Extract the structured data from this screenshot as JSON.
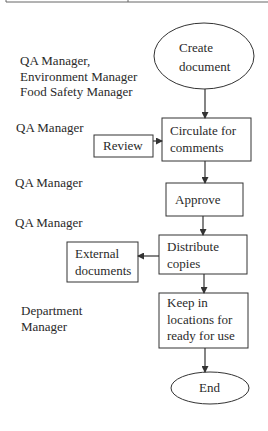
{
  "diagram": {
    "type": "flowchart",
    "roles": [
      {
        "id": "role-create",
        "lines": [
          "QA Manager,",
          "Environment Manager",
          "Food Safety Manager"
        ]
      },
      {
        "id": "role-circulate",
        "lines": [
          "QA Manager"
        ]
      },
      {
        "id": "role-approve",
        "lines": [
          "QA Manager"
        ]
      },
      {
        "id": "role-distribute",
        "lines": [
          "QA Manager"
        ]
      },
      {
        "id": "role-keep",
        "lines": [
          "Department",
          "Manager"
        ]
      }
    ],
    "nodes": [
      {
        "id": "create",
        "shape": "ellipse",
        "lines": [
          "Create",
          "document"
        ]
      },
      {
        "id": "circulate",
        "shape": "rect",
        "lines": [
          "Circulate for",
          "comments"
        ]
      },
      {
        "id": "review",
        "shape": "rect",
        "lines": [
          "Review"
        ]
      },
      {
        "id": "approve",
        "shape": "rect",
        "lines": [
          "Approve"
        ]
      },
      {
        "id": "distribute",
        "shape": "rect",
        "lines": [
          "Distribute",
          "copies"
        ]
      },
      {
        "id": "external",
        "shape": "rect",
        "lines": [
          "External",
          "documents"
        ]
      },
      {
        "id": "keep",
        "shape": "rect",
        "lines": [
          "Keep in",
          "locations for",
          "ready for use"
        ]
      },
      {
        "id": "end",
        "shape": "ellipse",
        "lines": [
          "End"
        ]
      }
    ],
    "edges": [
      {
        "from": "create",
        "to": "circulate"
      },
      {
        "from": "review",
        "to": "circulate"
      },
      {
        "from": "circulate",
        "to": "approve"
      },
      {
        "from": "approve",
        "to": "distribute"
      },
      {
        "from": "distribute",
        "to": "external"
      },
      {
        "from": "distribute",
        "to": "keep"
      },
      {
        "from": "keep",
        "to": "end"
      }
    ]
  }
}
